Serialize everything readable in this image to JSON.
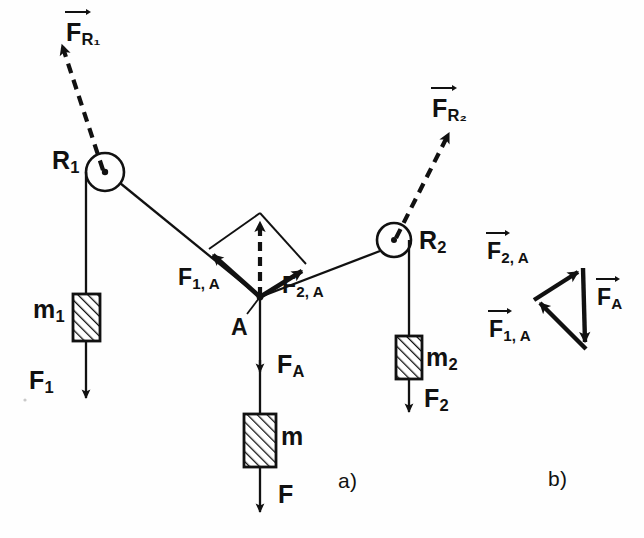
{
  "figure": {
    "background_color": "#fefefe",
    "stroke_color": "#111111"
  },
  "panels": [
    {
      "id": "a",
      "label": "a)",
      "x": 338,
      "y": 470
    },
    {
      "id": "b",
      "label": "b)",
      "x": 548,
      "y": 468
    }
  ],
  "labels": {
    "pulley_1": {
      "text": "R",
      "sub": "1",
      "x": 52,
      "y": 148
    },
    "pulley_2": {
      "text": "R",
      "sub": "2",
      "x": 418,
      "y": 228
    },
    "force_pulley_1": {
      "text": "F",
      "sub": "R₁",
      "x": 66,
      "y": 20
    },
    "force_pulley_2": {
      "text": "F",
      "sub": "R₂",
      "x": 430,
      "y": 96
    },
    "mass_1": {
      "text": "m",
      "sub": "1",
      "x": 36,
      "y": 297
    },
    "mass_2": {
      "text": "m",
      "sub": "2",
      "x": 424,
      "y": 345
    },
    "mass_center": {
      "text": "m",
      "sub": "",
      "x": 280,
      "y": 423
    },
    "force_1": {
      "text": "F",
      "sub": "1",
      "x": 30,
      "y": 383
    },
    "force_2": {
      "text": "F",
      "sub": "2",
      "x": 424,
      "y": 388
    },
    "force_bottom": {
      "text": "F",
      "sub": "",
      "x": 278,
      "y": 483
    },
    "force_A": {
      "text": "F",
      "sub": "A",
      "x": 278,
      "y": 355
    },
    "point_A": {
      "text": "A",
      "sub": "",
      "x": 234,
      "y": 318
    },
    "force_1A": {
      "text": "F",
      "sub": "1, A",
      "x": 178,
      "y": 268
    },
    "force_2A": {
      "text": "F",
      "sub": "2, A",
      "x": 280,
      "y": 275
    },
    "tri_force_2A": {
      "text": "F",
      "sub": "2, A",
      "x": 487,
      "y": 242
    },
    "tri_force_1A": {
      "text": "F",
      "sub": "1, A",
      "x": 489,
      "y": 320
    },
    "tri_force_A": {
      "text": "F",
      "sub": "A",
      "x": 595,
      "y": 288
    }
  },
  "geometry": {
    "pulley_1": {
      "cx": 105,
      "cy": 172,
      "r": 19
    },
    "pulley_2": {
      "cx": 394,
      "cy": 240,
      "r": 17
    },
    "point_A": {
      "x": 260,
      "y": 297
    },
    "parallelogram_apex": {
      "x": 260,
      "y": 215
    },
    "arrow_1A_head": {
      "x": 209,
      "y": 251
    },
    "arrow_2A_head": {
      "x": 306,
      "y": 267
    },
    "vector_FR1_tip": {
      "x": 55,
      "y": 33
    },
    "vector_FR2_tip": {
      "x": 445,
      "y": 128
    },
    "mass_1_block": {
      "x": 74,
      "y": 294,
      "w": 26,
      "h": 46
    },
    "mass_2_block": {
      "x": 396,
      "y": 336,
      "w": 24,
      "h": 42
    },
    "mass_center_block": {
      "x": 245,
      "y": 414,
      "w": 30,
      "h": 52
    },
    "force_triangle": {
      "left": {
        "x": 534,
        "y": 300
      },
      "top_right": {
        "x": 583,
        "y": 268
      },
      "bottom_right": {
        "x": 586,
        "y": 349
      }
    }
  },
  "elements": {
    "strings": "solid thin lines from pulleys to point A and to hanging masses",
    "dashed_vectors": "dashed arrows for resultant pulley forces and resultant at A",
    "hatching": "diagonal hatch fill inside mass blocks"
  }
}
